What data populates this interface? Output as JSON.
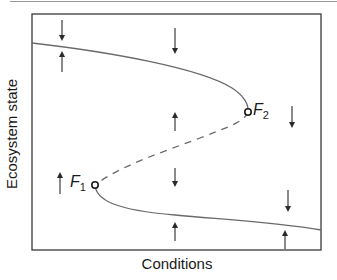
{
  "figure": {
    "type": "fold-bifurcation",
    "x_axis_label": "Conditions",
    "y_axis_label": "Ecosystem state",
    "colors": {
      "frame": "#3a3a3a",
      "curve": "#6a6a6a",
      "arrow": "#2a2a2a",
      "text": "#1a1a1a"
    },
    "points": [
      {
        "id": "F1",
        "label": "F",
        "subscript": "1",
        "description": "lower tipping point"
      },
      {
        "id": "F2",
        "label": "F",
        "subscript": "2",
        "description": "upper tipping point"
      }
    ],
    "branches": [
      {
        "name": "upper-stable-branch",
        "style": "solid"
      },
      {
        "name": "unstable-middle-branch",
        "style": "dashed"
      },
      {
        "name": "lower-stable-branch",
        "style": "solid"
      }
    ],
    "arrows": [
      {
        "x": 62,
        "y1": 22,
        "y2": 38,
        "direction": "down"
      },
      {
        "x": 62,
        "y1": 70,
        "y2": 54,
        "direction": "up"
      },
      {
        "x": 175,
        "y1": 29,
        "y2": 51,
        "direction": "down"
      },
      {
        "x": 175,
        "y1": 157,
        "y2": 137,
        "direction": "down-inverted"
      },
      {
        "x": 292,
        "y1": 108,
        "y2": 126,
        "direction": "down"
      },
      {
        "x": 60,
        "y1": 192,
        "y2": 175,
        "direction": "up"
      },
      {
        "x": 175,
        "y1": 133,
        "y2": 114,
        "direction": "up"
      },
      {
        "x": 175,
        "y1": 240,
        "y2": 225,
        "direction": "up"
      },
      {
        "x": 288,
        "y1": 192,
        "y2": 209,
        "direction": "down"
      },
      {
        "x": 285,
        "y1": 248,
        "y2": 233,
        "direction": "up"
      }
    ]
  }
}
